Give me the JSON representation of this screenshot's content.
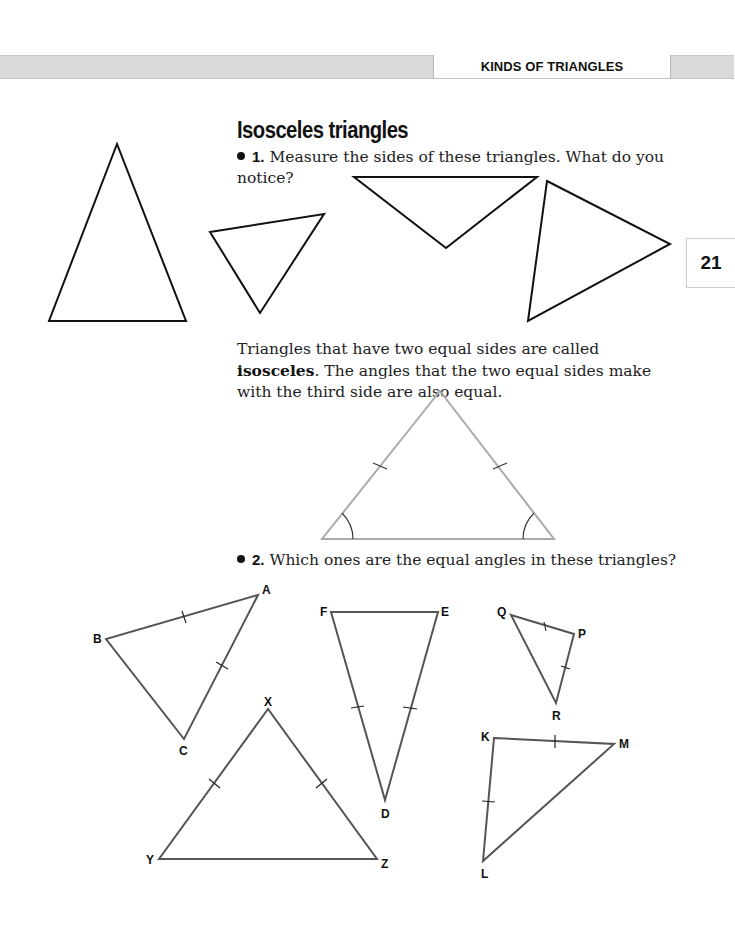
{
  "header": {
    "section_label": "KINDS OF TRIANGLES",
    "page_number": "21"
  },
  "section": {
    "title": "Isosceles triangles"
  },
  "question1": {
    "number": "1.",
    "text": "Measure the sides of these triangles. What do you notice?"
  },
  "definition": {
    "before": "Triangles that have two equal sides are called ",
    "term": "isosceles",
    "after": ". The angles that the two equal sides make with the third side are also equal."
  },
  "question2": {
    "number": "2.",
    "text": "Which ones are the equal angles in these triangles?"
  },
  "exercise_triangles": [
    {
      "name": "ABC",
      "vertices": [
        "A",
        "B",
        "C"
      ],
      "equal_sides": [
        "AB",
        "AC"
      ]
    },
    {
      "name": "DEF",
      "vertices": [
        "D",
        "E",
        "F"
      ],
      "equal_sides": [
        "DF",
        "DE"
      ]
    },
    {
      "name": "PQR",
      "vertices": [
        "P",
        "Q",
        "R"
      ],
      "equal_sides": [
        "PQ",
        "PR"
      ]
    },
    {
      "name": "XYZ",
      "vertices": [
        "X",
        "Y",
        "Z"
      ],
      "equal_sides": [
        "XY",
        "XZ"
      ]
    },
    {
      "name": "KLM",
      "vertices": [
        "K",
        "L",
        "M"
      ],
      "equal_sides": [
        "KM",
        "KL"
      ]
    }
  ],
  "colors": {
    "figure_line": "#111111",
    "diagram_line": "#aaaaaa",
    "exercise_line": "#555555",
    "header_band": "#d9d9d9"
  }
}
